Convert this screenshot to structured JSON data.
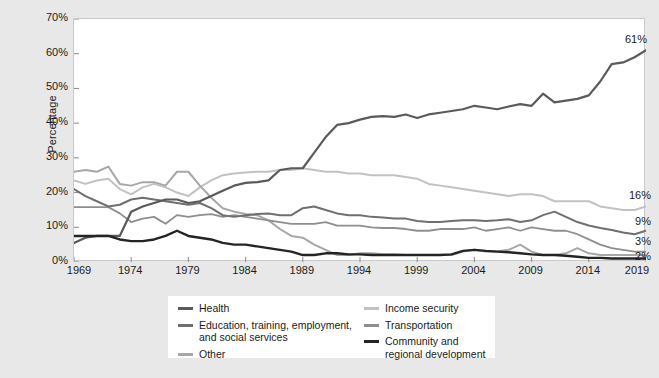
{
  "chart_data": {
    "type": "line",
    "title": "",
    "xlabel": "",
    "ylabel": "Percentage",
    "xlim": [
      1969,
      2019
    ],
    "ylim": [
      0,
      70
    ],
    "grid": false,
    "legend_position": "bottom",
    "y_ticks": [
      "0%",
      "10%",
      "20%",
      "30%",
      "40%",
      "50%",
      "60%",
      "70%"
    ],
    "y_tick_values": [
      0,
      10,
      20,
      30,
      40,
      50,
      60,
      70
    ],
    "x_ticks": [
      "1969",
      "1974",
      "1979",
      "1984",
      "1989",
      "1994",
      "1999",
      "2004",
      "2009",
      "2014",
      "2019"
    ],
    "x_tick_values": [
      1969,
      1974,
      1979,
      1984,
      1989,
      1994,
      1999,
      2004,
      2009,
      2014,
      2019
    ],
    "x": [
      1969,
      1970,
      1971,
      1972,
      1973,
      1974,
      1975,
      1976,
      1977,
      1978,
      1979,
      1980,
      1981,
      1982,
      1983,
      1984,
      1985,
      1986,
      1987,
      1988,
      1989,
      1990,
      1991,
      1992,
      1993,
      1994,
      1995,
      1996,
      1997,
      1998,
      1999,
      2000,
      2001,
      2002,
      2003,
      2004,
      2005,
      2006,
      2007,
      2008,
      2009,
      2010,
      2011,
      2012,
      2013,
      2014,
      2015,
      2016,
      2017,
      2018,
      2019
    ],
    "series": [
      {
        "name": "Health",
        "color": "#5a5a5a",
        "width": 2.2,
        "end_label": "61%",
        "end_value": 61,
        "values": [
          5.5,
          7.0,
          7.5,
          7.5,
          7.5,
          14.5,
          16.0,
          17.0,
          18.0,
          18.0,
          17.0,
          17.5,
          19.0,
          20.5,
          22.0,
          22.8,
          23.0,
          23.5,
          26.5,
          27.0,
          27.0,
          31.5,
          36.0,
          39.5,
          40.0,
          41.0,
          41.8,
          42.0,
          41.8,
          42.5,
          41.5,
          42.5,
          43.0,
          43.5,
          44.0,
          45.0,
          44.5,
          44.0,
          44.8,
          45.5,
          45.0,
          48.5,
          46.0,
          46.5,
          47.0,
          48.0,
          52.0,
          57.0,
          57.5,
          59.0,
          61.0
        ]
      },
      {
        "name": "Education, training, employment, and social services",
        "color": "#6f6f6f",
        "width": 2.0,
        "end_label": "9%",
        "end_value": 9,
        "values": [
          21.0,
          19.0,
          17.5,
          16.0,
          16.5,
          18.0,
          18.5,
          18.0,
          17.5,
          17.0,
          16.5,
          17.0,
          15.5,
          13.5,
          13.0,
          13.5,
          13.8,
          14.0,
          13.5,
          13.5,
          15.5,
          16.0,
          15.0,
          14.0,
          13.5,
          13.5,
          13.0,
          12.8,
          12.5,
          12.5,
          11.8,
          11.5,
          11.5,
          11.8,
          12.0,
          12.0,
          11.8,
          12.0,
          12.3,
          11.5,
          12.0,
          13.5,
          14.5,
          13.0,
          11.5,
          10.5,
          9.8,
          9.2,
          8.5,
          8.0,
          9.0
        ]
      },
      {
        "name": "Other",
        "color": "#a7a7a7",
        "width": 2.0,
        "end_label": "2%",
        "end_value": 2,
        "values": [
          26.0,
          26.5,
          26.0,
          27.5,
          22.5,
          22.0,
          23.0,
          23.0,
          22.0,
          26.0,
          26.0,
          22.0,
          18.5,
          15.5,
          14.5,
          13.8,
          13.5,
          12.0,
          9.5,
          7.5,
          7.0,
          5.0,
          3.5,
          2.0,
          2.0,
          2.5,
          2.5,
          2.2,
          2.2,
          2.0,
          2.0,
          2.0,
          2.0,
          2.0,
          3.0,
          3.5,
          3.0,
          3.0,
          3.5,
          5.0,
          3.0,
          2.0,
          2.0,
          2.5,
          4.0,
          2.5,
          2.0,
          2.0,
          2.0,
          2.0,
          2.0
        ]
      },
      {
        "name": "Income security",
        "color": "#c2c2c2",
        "width": 2.0,
        "end_label": "16%",
        "end_value": 16,
        "values": [
          23.5,
          22.5,
          23.5,
          24.0,
          21.0,
          19.5,
          21.5,
          22.5,
          21.5,
          20.0,
          19.0,
          21.5,
          23.5,
          25.0,
          25.5,
          25.8,
          26.0,
          26.0,
          26.5,
          26.5,
          27.0,
          26.5,
          26.0,
          26.0,
          25.5,
          25.5,
          25.0,
          25.0,
          25.0,
          24.5,
          24.0,
          22.5,
          22.0,
          21.5,
          21.0,
          20.5,
          20.0,
          19.5,
          19.0,
          19.5,
          19.5,
          19.0,
          17.5,
          17.5,
          17.5,
          17.5,
          16.0,
          15.5,
          15.0,
          15.0,
          16.0
        ]
      },
      {
        "name": "Transportation",
        "color": "#8e8e8e",
        "width": 1.8,
        "end_label": "3%",
        "end_value": 3,
        "values": [
          15.8,
          15.8,
          15.8,
          15.8,
          14.0,
          11.5,
          12.5,
          13.0,
          11.0,
          13.5,
          13.0,
          13.5,
          13.8,
          13.0,
          13.5,
          13.0,
          12.5,
          12.0,
          11.5,
          11.0,
          11.0,
          11.0,
          11.5,
          10.5,
          10.5,
          10.5,
          10.0,
          9.8,
          9.8,
          9.5,
          9.0,
          9.0,
          9.5,
          9.5,
          9.5,
          10.0,
          9.0,
          9.5,
          10.0,
          9.0,
          10.0,
          9.5,
          9.0,
          9.0,
          8.0,
          6.5,
          5.0,
          4.0,
          3.5,
          3.0,
          3.0
        ]
      },
      {
        "name": "Community and regional development",
        "color": "#242424",
        "width": 2.4,
        "end_label": "",
        "end_value": 1,
        "values": [
          7.5,
          7.5,
          7.5,
          7.5,
          6.5,
          6.0,
          6.0,
          6.5,
          7.5,
          9.0,
          7.5,
          7.0,
          6.5,
          5.5,
          5.0,
          5.0,
          4.5,
          4.0,
          3.5,
          3.0,
          2.0,
          2.0,
          2.5,
          2.5,
          2.2,
          2.2,
          2.0,
          2.0,
          2.0,
          2.0,
          2.0,
          2.0,
          2.0,
          2.2,
          3.2,
          3.5,
          3.2,
          3.0,
          2.8,
          2.5,
          2.2,
          2.0,
          2.0,
          1.8,
          1.5,
          1.2,
          1.2,
          1.0,
          1.0,
          1.0,
          1.0
        ]
      }
    ],
    "end_labels": [
      {
        "text": "61%",
        "value": 61
      },
      {
        "text": "16%",
        "value": 16
      },
      {
        "text": "9%",
        "value": 9
      },
      {
        "text": "3%",
        "value": 3
      },
      {
        "text": "2%",
        "value": 2
      }
    ],
    "legend": {
      "left_column": [
        {
          "label": "Health",
          "color": "#5a5a5a"
        },
        {
          "label": "Education, training, employment, and social services",
          "color": "#6f6f6f"
        },
        {
          "label": "Other",
          "color": "#a7a7a7"
        }
      ],
      "right_column": [
        {
          "label": "Income security",
          "color": "#c2c2c2"
        },
        {
          "label": "Transportation",
          "color": "#8e8e8e"
        },
        {
          "label": "Community and regional development",
          "color": "#242424"
        }
      ]
    }
  }
}
